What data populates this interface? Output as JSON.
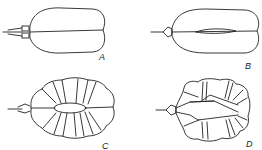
{
  "figure": {
    "panels": [
      {
        "id": "A",
        "label": "A"
      },
      {
        "id": "B",
        "label": "B"
      },
      {
        "id": "C",
        "label": "C"
      },
      {
        "id": "D",
        "label": "D"
      }
    ],
    "colors": {
      "line": "#222222",
      "background": "#ffffff"
    }
  }
}
